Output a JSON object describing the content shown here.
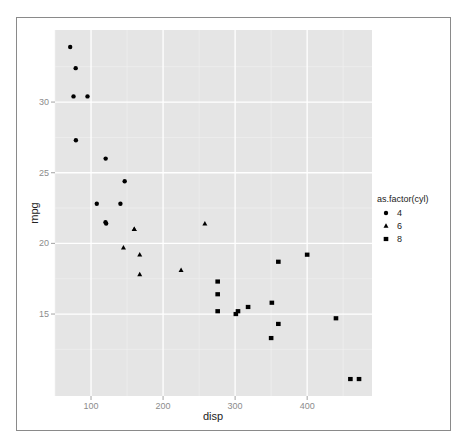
{
  "chart_data": {
    "type": "scatter",
    "title": "",
    "xlabel": "disp",
    "ylabel": "mpg",
    "xlim": [
      50,
      490
    ],
    "ylim": [
      9.2,
      35.1
    ],
    "x_ticks": [
      100,
      200,
      300,
      400
    ],
    "y_ticks": [
      15,
      20,
      25,
      30
    ],
    "grid": true,
    "legend": {
      "title": "as.factor(cyl)",
      "position": "right",
      "entries": [
        {
          "label": "4",
          "shape": "circle"
        },
        {
          "label": "6",
          "shape": "triangle"
        },
        {
          "label": "8",
          "shape": "square"
        }
      ]
    },
    "series": [
      {
        "name": "4",
        "shape": "circle",
        "points": [
          [
            108,
            22.8
          ],
          [
            146.7,
            24.4
          ],
          [
            140.8,
            22.8
          ],
          [
            78.7,
            32.4
          ],
          [
            75.7,
            30.4
          ],
          [
            71.1,
            33.9
          ],
          [
            120.1,
            21.5
          ],
          [
            79,
            27.3
          ],
          [
            120.3,
            26.0
          ],
          [
            95.1,
            30.4
          ],
          [
            121,
            21.4
          ]
        ]
      },
      {
        "name": "6",
        "shape": "triangle",
        "points": [
          [
            160,
            21.0
          ],
          [
            160,
            21.0
          ],
          [
            258,
            21.4
          ],
          [
            225,
            18.1
          ],
          [
            167.6,
            19.2
          ],
          [
            167.6,
            17.8
          ],
          [
            145,
            19.7
          ]
        ]
      },
      {
        "name": "8",
        "shape": "square",
        "points": [
          [
            360,
            18.7
          ],
          [
            360,
            14.3
          ],
          [
            275.8,
            16.4
          ],
          [
            275.8,
            17.3
          ],
          [
            275.8,
            15.2
          ],
          [
            472,
            10.4
          ],
          [
            460,
            10.4
          ],
          [
            440,
            14.7
          ],
          [
            318,
            15.5
          ],
          [
            304,
            15.2
          ],
          [
            350,
            13.3
          ],
          [
            400,
            19.2
          ],
          [
            351,
            15.8
          ],
          [
            301,
            15.0
          ]
        ]
      }
    ]
  },
  "colors": {
    "panel_bg": "#e5e5e5",
    "grid_major": "#ffffff",
    "grid_minor": "#f2f2f2",
    "point": "#000000"
  }
}
